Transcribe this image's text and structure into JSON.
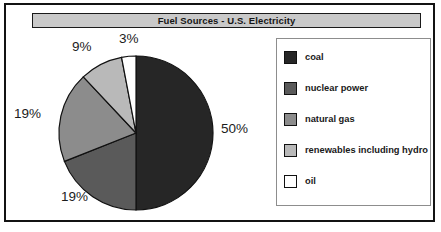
{
  "chart_data": {
    "type": "pie",
    "title": "Fuel Sources - U.S. Electricity",
    "categories": [
      "coal",
      "nuclear power",
      "natural gas",
      "renewables including hydro",
      "oil"
    ],
    "values": [
      50,
      19,
      19,
      9,
      3
    ],
    "value_labels": [
      "50%",
      "19%",
      "19%",
      "9%",
      "3%"
    ],
    "units": "percent",
    "start_angle_deg": 0,
    "direction": "clockwise",
    "legend_position": "right",
    "grid": false,
    "colors": [
      "#262626",
      "#5a5a5a",
      "#8c8c8c",
      "#b9b9b9",
      "#ffffff"
    ],
    "slice_outline_color": "#111111"
  },
  "header": {
    "title": "Fuel Sources - U.S. Electricity"
  },
  "pie": {
    "labels": [
      {
        "text": "50%",
        "x": 207,
        "y": 90
      },
      {
        "text": "19%",
        "x": 47,
        "y": 158
      },
      {
        "text": "19%",
        "x": 0,
        "y": 75
      },
      {
        "text": "9%",
        "x": 58,
        "y": 8
      },
      {
        "text": "3%",
        "x": 105,
        "y": 0
      }
    ]
  },
  "legend": {
    "items": [
      {
        "label": "coal",
        "color": "#262626"
      },
      {
        "label": "nuclear power",
        "color": "#5a5a5a"
      },
      {
        "label": "natural gas",
        "color": "#8c8c8c"
      },
      {
        "label": "renewables including hydro",
        "color": "#b9b9b9"
      },
      {
        "label": "oil",
        "color": "#ffffff"
      }
    ]
  },
  "style": {
    "frame_color": "#131313",
    "title_bar_color": "#c9c9c9",
    "background": "#ffffff"
  }
}
